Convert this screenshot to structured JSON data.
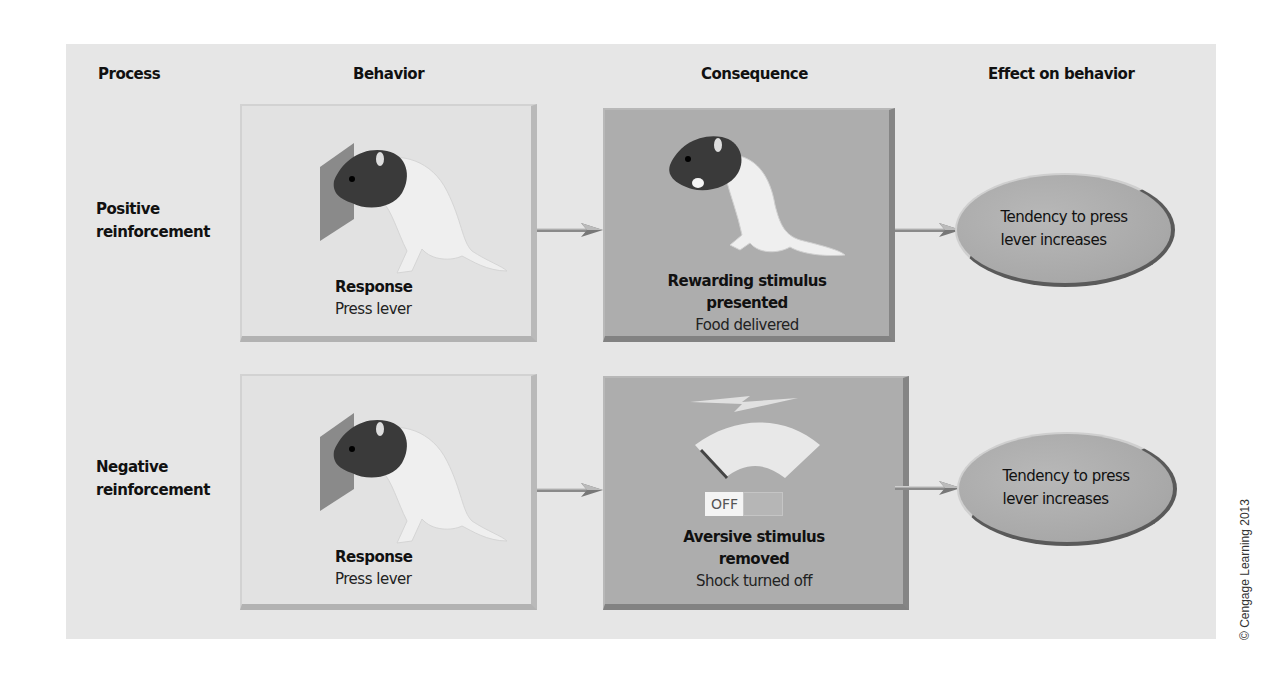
{
  "columns": {
    "process": "Process",
    "behavior": "Behavior",
    "consequence": "Consequence",
    "effect": "Effect on behavior"
  },
  "rows": [
    {
      "process_line1": "Positive",
      "process_line2": "reinforcement",
      "behavior": {
        "title": "Response",
        "subtitle": "Press lever",
        "icon": "rat-pressing-lever"
      },
      "consequence": {
        "title_line1": "Rewarding stimulus",
        "title_line2": "presented",
        "subtitle": "Food delivered",
        "icon": "rat-eating"
      },
      "effect_line1": "Tendency to press",
      "effect_line2": "lever increases"
    },
    {
      "process_line1": "Negative",
      "process_line2": "reinforcement",
      "behavior": {
        "title": "Response",
        "subtitle": "Press lever",
        "icon": "rat-pressing-lever"
      },
      "consequence": {
        "title_line1": "Aversive stimulus",
        "title_line2": "removed",
        "subtitle": "Shock turned off",
        "icon": "shock-meter",
        "switch_label": "OFF"
      },
      "effect_line1": "Tendency to press",
      "effect_line2": "lever increases"
    }
  ],
  "copyright": "© Cengage Learning 2013",
  "colors": {
    "panel": "#e6e6e6",
    "behavior_box": "#e2e2e2",
    "consequence_box": "#adadad",
    "effect_ellipse": "#aaaaaa"
  }
}
